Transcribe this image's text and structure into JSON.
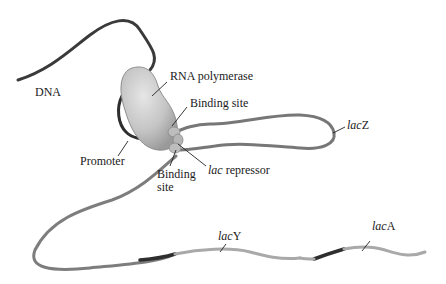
{
  "diagram": {
    "labels": {
      "dna": "DNA",
      "rna_polymerase": "RNA polymerase",
      "binding_site_top": "Binding site",
      "promoter": "Promoter",
      "binding_site_bottom_line1": "Binding",
      "binding_site_bottom_line2": "site",
      "lac_repressor_italic": "lac",
      "lac_repressor_rest": " repressor",
      "lacZ_italic": "lac",
      "lacZ_rest": "Z",
      "lacY_italic": "lac",
      "lacY_rest": "Y",
      "lacA_italic": "lac",
      "lacA_rest": "A"
    },
    "colors": {
      "dna_dark": "#3a3a3a",
      "dna_mid": "#7d7d7d",
      "dna_light": "#a9a9a9",
      "dna_band": "#2e2e2e",
      "polymerase_fill": "#c9c9c9",
      "repressor_fill": "#bdbdbd",
      "leader_line": "#222222"
    }
  }
}
